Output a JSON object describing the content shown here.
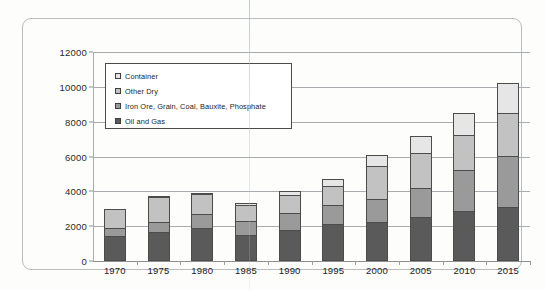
{
  "chart_data": {
    "type": "bar",
    "subtype": "stacked-bar",
    "title": "",
    "xlabel": "",
    "ylabel": "",
    "categories": [
      "1970",
      "1975",
      "1980",
      "1985",
      "1990",
      "1995",
      "2000",
      "2005",
      "2010",
      "2015"
    ],
    "ylim": [
      0,
      12000
    ],
    "ytick_labels": [
      "0",
      "2000",
      "4000",
      "6000",
      "8000",
      "10000",
      "12000"
    ],
    "ytick_values": [
      0,
      2000,
      4000,
      6000,
      8000,
      10000,
      12000
    ],
    "grid": true,
    "legend_position": "upper-left-inside",
    "series": [
      {
        "name": "Oil and Gas",
        "color": "#5a5a5a",
        "values": [
          1440,
          1680,
          1870,
          1500,
          1760,
          2110,
          2240,
          2520,
          2880,
          3080
        ]
      },
      {
        "name": "Iron Ore, Grain, Coal, Bauxite, Phosphate",
        "color": "#9a9a9a",
        "values": [
          450,
          580,
          830,
          780,
          990,
          1110,
          1310,
          1680,
          2320,
          2930
        ]
      },
      {
        "name": "Other Dry",
        "color": "#c2c2c2",
        "values": [
          1110,
          1440,
          1150,
          950,
          1020,
          1060,
          1900,
          2030,
          2040,
          2480
        ]
      },
      {
        "name": "Container",
        "color": "#e6e6e6",
        "values": [
          0,
          50,
          60,
          90,
          270,
          420,
          620,
          970,
          1260,
          1710
        ]
      }
    ],
    "totals": [
      3000,
      3750,
      3910,
      3320,
      4040,
      4700,
      6070,
      7200,
      8500,
      10200
    ]
  },
  "legend": {
    "items": [
      {
        "label": "Container",
        "color": "#e6e6e6"
      },
      {
        "label": "Other Dry",
        "color": "#c2c2c2"
      },
      {
        "label": "Iron Ore, Grain, Coal, Bauxite, Phosphate",
        "color": "#9a9a9a"
      },
      {
        "label": "Oil and Gas",
        "color": "#5a5a5a"
      }
    ]
  }
}
